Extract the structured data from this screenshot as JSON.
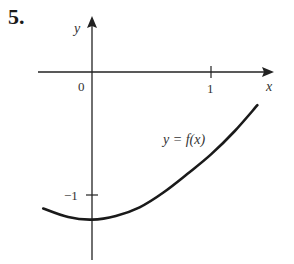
{
  "problem_number": "5.",
  "chart_data": {
    "type": "line",
    "title": "",
    "xlabel": "x",
    "ylabel": "y",
    "x_ticks": [
      {
        "value": 0,
        "label": "0"
      },
      {
        "value": 1,
        "label": "1"
      }
    ],
    "y_ticks": [
      {
        "value": -1,
        "label": "−1"
      }
    ],
    "grid": false,
    "legend": null,
    "annotations": [
      {
        "text": "y = f(x)",
        "x": 0.85,
        "y": -0.55
      }
    ],
    "series": [
      {
        "name": "y = f(x)",
        "x": [
          -0.41,
          -0.2,
          0,
          0.2,
          0.4,
          0.6,
          0.8,
          1.0,
          1.2,
          1.39
        ],
        "y": [
          -1.11,
          -1.18,
          -1.2,
          -1.17,
          -1.1,
          -0.98,
          -0.83,
          -0.67,
          -0.48,
          -0.27
        ]
      }
    ],
    "xlim": [
      -0.45,
      1.5
    ],
    "ylim": [
      -1.5,
      0.3
    ]
  },
  "labels": {
    "x_axis": "x",
    "y_axis": "y",
    "origin": "0",
    "tick_x1": "1",
    "tick_yneg1": "−1",
    "curve": "y = f(x)"
  }
}
